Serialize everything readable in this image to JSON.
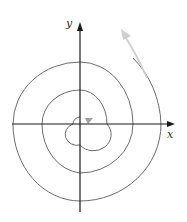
{
  "figure": {
    "axes": {
      "x_label": "x",
      "y_label": "y"
    },
    "colors": {
      "axis": "#1a1a1a",
      "spiral": "#6e6e6e",
      "arrow_primary": "#c8c8c8",
      "arrow_center": "#9a9a9a",
      "background": "#ffffff"
    },
    "spiral": {
      "type": "archimedean",
      "turns": 3,
      "direction": "outward counterclockwise"
    },
    "arrows": [
      {
        "name": "outer-direction-arrow",
        "location": "upper-right outside spiral"
      },
      {
        "name": "center-direction-arrow",
        "location": "near origin"
      }
    ]
  }
}
